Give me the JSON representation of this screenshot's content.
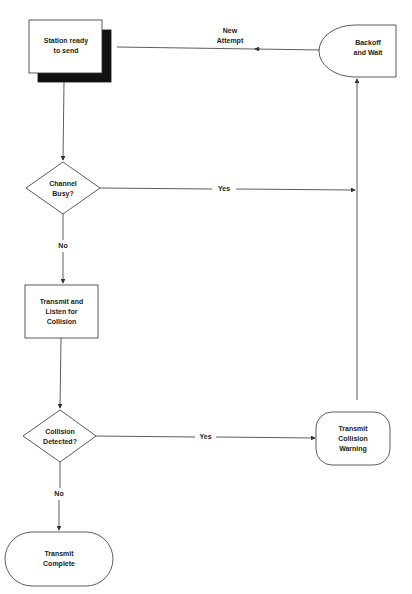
{
  "diagram": {
    "nodes": {
      "station_ready": {
        "line1": "Station ready",
        "line2": "to send"
      },
      "backoff": {
        "line1": "Backoff",
        "line2": "and Wait"
      },
      "channel_busy": {
        "line1": "Channel",
        "line2": "Busy?"
      },
      "transmit_listen": {
        "line1": "Transmit and",
        "line2": "Listen for",
        "line3": "Collision"
      },
      "collision_detected": {
        "line1": "Collision",
        "line2": "Detected?"
      },
      "collision_warning": {
        "line1": "Transmit",
        "line2": "Collision",
        "line3": "Warning"
      },
      "transmit_complete": {
        "line1": "Transmit",
        "line2": "Complete"
      }
    },
    "edges": {
      "new_attempt": {
        "line1": "New",
        "line2": "Attempt"
      },
      "busy_yes": "Yes",
      "busy_no": "No",
      "collision_yes": "Yes",
      "collision_no": "No"
    },
    "colors": {
      "stroke": "#333333",
      "shadow": "#111111",
      "text": "#222222"
    }
  }
}
